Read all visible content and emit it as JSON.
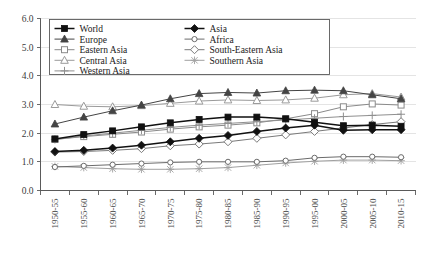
{
  "chart_data": {
    "type": "line",
    "title": "",
    "subtitle": "",
    "xlabel": "",
    "ylabel": "",
    "ylim": [
      0.0,
      6.0
    ],
    "yticks": [
      "0.0",
      "1.0",
      "2.0",
      "3.0",
      "4.0",
      "5.0",
      "6.0"
    ],
    "ytick_values": [
      0.0,
      1.0,
      2.0,
      3.0,
      4.0,
      5.0,
      6.0
    ],
    "grid": true,
    "legend_position": "top-inside",
    "categories": [
      "1950-55",
      "1955-60",
      "1960-65",
      "1965-70",
      "1970-75",
      "1975-80",
      "1980-85",
      "1985-90",
      "1990-95",
      "1995-00",
      "2000-05",
      "2005-10",
      "2010-15"
    ],
    "series": [
      {
        "name": "World",
        "marker": "filled-square",
        "color": "#111111",
        "values": [
          1.8,
          1.95,
          2.08,
          2.22,
          2.36,
          2.48,
          2.56,
          2.56,
          2.5,
          2.38,
          2.26,
          2.28,
          2.24
        ]
      },
      {
        "name": "Asia",
        "marker": "filled-diamond",
        "color": "#111111",
        "values": [
          1.36,
          1.4,
          1.48,
          1.58,
          1.7,
          1.82,
          1.92,
          2.06,
          2.18,
          2.28,
          2.1,
          2.12,
          2.12
        ]
      },
      {
        "name": "Europe",
        "marker": "filled-triangle",
        "color": "#444444",
        "values": [
          2.32,
          2.56,
          2.78,
          2.98,
          3.2,
          3.38,
          3.42,
          3.4,
          3.48,
          3.5,
          3.48,
          3.34,
          3.2
        ]
      },
      {
        "name": "Africa",
        "marker": "open-circle-small",
        "color": "#6b6b6b",
        "values": [
          0.82,
          0.86,
          0.9,
          0.94,
          0.98,
          1.0,
          1.0,
          1.0,
          1.04,
          1.14,
          1.18,
          1.18,
          1.16
        ]
      },
      {
        "name": "Eastern Asia",
        "marker": "open-square",
        "color": "#8a8a8a",
        "values": [
          1.78,
          1.88,
          1.96,
          2.04,
          2.14,
          2.22,
          2.28,
          2.36,
          2.5,
          2.68,
          2.92,
          3.02,
          2.98
        ]
      },
      {
        "name": "South-Eastern Asia",
        "marker": "open-diamond",
        "color": "#7a7a7a",
        "values": [
          1.34,
          1.36,
          1.4,
          1.46,
          1.56,
          1.62,
          1.7,
          1.82,
          1.94,
          2.06,
          2.18,
          2.3,
          2.4
        ]
      },
      {
        "name": "Central Asia",
        "marker": "open-triangle",
        "color": "#9a9a9a",
        "values": [
          3.0,
          2.94,
          2.92,
          2.96,
          3.04,
          3.12,
          3.16,
          3.14,
          3.16,
          3.22,
          3.34,
          3.38,
          3.26
        ]
      },
      {
        "name": "Southern Asia",
        "marker": "star-x",
        "color": "#a0a0a0",
        "values": [
          0.84,
          0.8,
          0.76,
          0.74,
          0.74,
          0.76,
          0.8,
          0.88,
          0.96,
          1.02,
          1.06,
          1.06,
          1.04
        ]
      },
      {
        "name": "Western Asia",
        "marker": "plus",
        "color": "#8f8f8f",
        "values": [
          1.78,
          1.9,
          2.0,
          2.1,
          2.2,
          2.28,
          2.34,
          2.4,
          2.46,
          2.52,
          2.58,
          2.62,
          2.66
        ]
      }
    ]
  },
  "legend": {
    "entries": [
      {
        "label": "World"
      },
      {
        "label": "Asia"
      },
      {
        "label": "Europe"
      },
      {
        "label": "Africa"
      },
      {
        "label": "Eastern Asia"
      },
      {
        "label": "South-Eastern Asia"
      },
      {
        "label": "Central Asia"
      },
      {
        "label": "Southern Asia"
      },
      {
        "label": "Western Asia"
      }
    ]
  }
}
